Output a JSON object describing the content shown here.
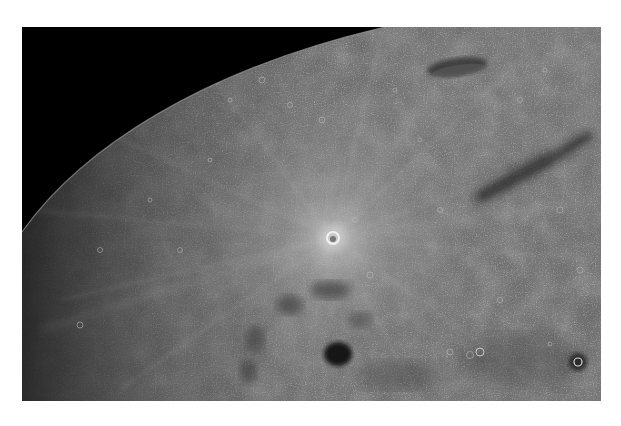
{
  "image": {
    "alt": "Oblique photograph of the lunar surface showing the curved limb against black space, a bright rayed crater near center, and dark mare patches",
    "colors": {
      "space": "#000000",
      "surface_base": "#6e6e6e",
      "surface_light": "#8c8c8c",
      "surface_dark": "#3c3c3c",
      "ray": "#b4b4b4",
      "page_background": "#ffffff"
    },
    "features": [
      {
        "name": "limb",
        "description": "curved horizon edge from lower-left to top-center"
      },
      {
        "name": "rayed-crater",
        "x": 333,
        "y": 238
      },
      {
        "name": "elongated-crater",
        "x": 455,
        "y": 68
      },
      {
        "name": "dark-round-patch",
        "x": 338,
        "y": 354
      },
      {
        "name": "dark-streak",
        "x": 525,
        "y": 165
      },
      {
        "name": "small-dark-crater",
        "x": 578,
        "y": 362
      }
    ]
  }
}
